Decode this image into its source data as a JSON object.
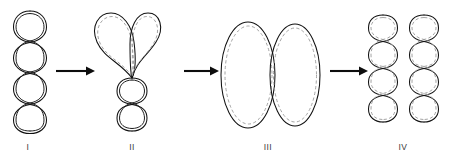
{
  "figure": {
    "background_color": "#ffffff",
    "stroke_color": "#111111",
    "dashed_color": "#9a9a9a",
    "arrow_color": "#0d0d0d",
    "panels": [
      {
        "id": "panel-1",
        "label": "I",
        "label_x": 28,
        "label_y": 150,
        "description": "plectonemic supercoil with four stacked loops, double solid strands",
        "loops": 4,
        "has_dashed_inner": false,
        "center_x": 30,
        "top_y": 10,
        "bottom_y": 134
      },
      {
        "id": "panel-2",
        "label": "II",
        "label_x": 132,
        "label_y": 150,
        "description": "two large open loops above a short two-loop plectoneme, solid outline with dashed inner line",
        "loops": 2,
        "has_dashed_inner": true,
        "center_x": 132,
        "top_y": 12,
        "bottom_y": 132
      },
      {
        "id": "panel-3",
        "label": "III",
        "label_x": 268,
        "label_y": 150,
        "description": "two adjacent vertical ellipses, solid outline with dashed inner line",
        "loops": 2,
        "has_dashed_inner": true,
        "center_x": 271,
        "top_y": 22,
        "bottom_y": 128
      },
      {
        "id": "panel-4",
        "label": "IV",
        "label_x": 403,
        "label_y": 150,
        "description": "two separate four-loop plectonemes side by side, solid outline with dashed inner line",
        "loops": 4,
        "has_dashed_inner": true,
        "center_x": 403,
        "top_y": 14,
        "bottom_y": 132
      }
    ],
    "arrows": [
      {
        "id": "arrow-1",
        "from": "I",
        "to": "II",
        "x1": 56,
        "x2": 94,
        "y": 71
      },
      {
        "id": "arrow-2",
        "from": "II",
        "to": "III",
        "x1": 184,
        "x2": 219,
        "y": 71
      },
      {
        "id": "arrow-3",
        "from": "III",
        "to": "IV",
        "x1": 330,
        "x2": 368,
        "y": 71
      }
    ]
  }
}
